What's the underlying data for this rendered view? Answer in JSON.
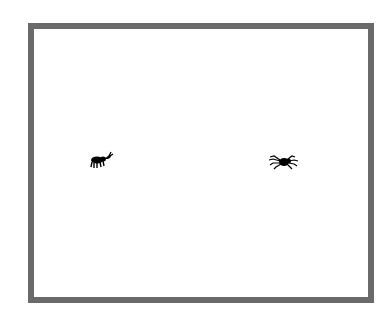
{
  "scene": {
    "frame_color": "#6a6a6a",
    "background_color": "#ffffff",
    "creatures": [
      {
        "name": "ant",
        "icon": "ant-icon",
        "color": "#000000"
      },
      {
        "name": "spider",
        "icon": "spider-icon",
        "color": "#000000"
      }
    ]
  }
}
